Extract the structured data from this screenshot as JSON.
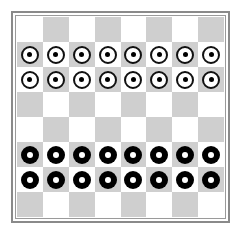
{
  "board": {
    "size": 8,
    "colors": {
      "light_square": "#ffffff",
      "dark_square": "#cfcfcf",
      "border": "#8a8a8a",
      "white_piece_fill": "#ffffff",
      "white_piece_ring": "#111111",
      "black_piece_fill": "#000000"
    },
    "first_square": "light",
    "rows": [
      [
        "",
        "",
        "",
        "",
        "",
        "",
        "",
        ""
      ],
      [
        "white",
        "white",
        "white",
        "white",
        "white",
        "white",
        "white",
        "white"
      ],
      [
        "white",
        "white",
        "white",
        "white",
        "white",
        "white",
        "white",
        "white"
      ],
      [
        "",
        "",
        "",
        "",
        "",
        "",
        "",
        ""
      ],
      [
        "",
        "",
        "",
        "",
        "",
        "",
        "",
        ""
      ],
      [
        "black",
        "black",
        "black",
        "black",
        "black",
        "black",
        "black",
        "black"
      ],
      [
        "black",
        "black",
        "black",
        "black",
        "black",
        "black",
        "black",
        "black"
      ],
      [
        "",
        "",
        "",
        "",
        "",
        "",
        "",
        ""
      ]
    ]
  },
  "pieces": {
    "white_count": 16,
    "black_count": 16,
    "white_icon": "white-ring-dot-piece",
    "black_icon": "black-ring-piece"
  }
}
